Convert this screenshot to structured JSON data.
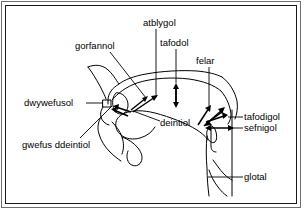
{
  "figure": {
    "type": "articulatory-diagram",
    "border_color": "#1a1a1a",
    "line_color": "#000000",
    "background": "#ffffff"
  },
  "labels": {
    "gorfannol": "gorfannol",
    "atblygol": "atblygol",
    "tafodol": "tafodol",
    "felar": "felar",
    "dwywefusol": "dwywefusol",
    "deintiol": "deintiol",
    "gwefus_ddeintiol": "gwefus ddeintiol",
    "tafodigol": "tafodigol",
    "sefnigol": "sefnigol",
    "glotal": "glotal"
  }
}
